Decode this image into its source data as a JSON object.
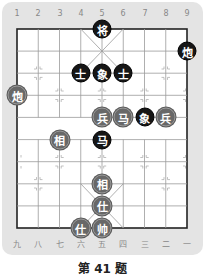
{
  "puzzle": {
    "title": "第 41 题",
    "top_file_labels": [
      "1",
      "2",
      "3",
      "4",
      "5",
      "6",
      "7",
      "8",
      "9"
    ],
    "bottom_file_labels": [
      "九",
      "八",
      "七",
      "六",
      "五",
      "四",
      "三",
      "二",
      "一"
    ]
  },
  "colors": {
    "frame": "#e4e4e4",
    "black_piece": "#161616",
    "red_piece": "#686868",
    "grid": "#999999"
  },
  "pieces": [
    {
      "char": "将",
      "side": "black",
      "col": 5,
      "row": 0
    },
    {
      "char": "炮",
      "side": "black",
      "col": 9,
      "row": 1
    },
    {
      "char": "士",
      "side": "black",
      "col": 4,
      "row": 2
    },
    {
      "char": "象",
      "side": "black",
      "col": 5,
      "row": 2
    },
    {
      "char": "士",
      "side": "black",
      "col": 6,
      "row": 2
    },
    {
      "char": "炮",
      "side": "red",
      "col": 1,
      "row": 3
    },
    {
      "char": "兵",
      "side": "red",
      "col": 5,
      "row": 4
    },
    {
      "char": "马",
      "side": "red",
      "col": 6,
      "row": 4
    },
    {
      "char": "象",
      "side": "black",
      "col": 7,
      "row": 4
    },
    {
      "char": "兵",
      "side": "red",
      "col": 8,
      "row": 4
    },
    {
      "char": "相",
      "side": "red",
      "col": 3,
      "row": 5
    },
    {
      "char": "马",
      "side": "black",
      "col": 5,
      "row": 5
    },
    {
      "char": "相",
      "side": "red",
      "col": 5,
      "row": 7
    },
    {
      "char": "仕",
      "side": "red",
      "col": 5,
      "row": 8
    },
    {
      "char": "仕",
      "side": "red",
      "col": 4,
      "row": 9
    },
    {
      "char": "帅",
      "side": "red",
      "col": 5,
      "row": 9
    }
  ]
}
